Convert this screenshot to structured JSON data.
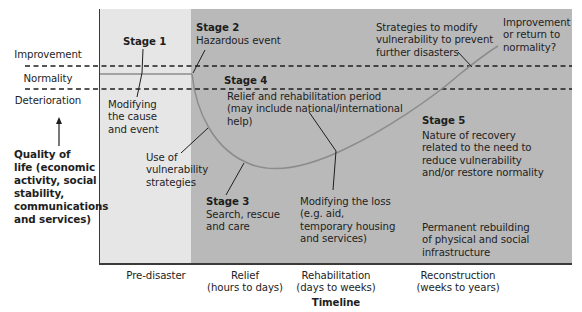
{
  "diagram": {
    "type": "disaster-response-curve",
    "colors": {
      "pre_disaster_region": "#e6e6e6",
      "post_disaster_region": "#b9b9b9",
      "curve": "#8c8c8c",
      "dashed_lines": "#1e1e1e",
      "text": "#1e1e1e"
    },
    "y_axis": {
      "levels": [
        "Improvement",
        "Normality",
        "Deterioration"
      ],
      "label": [
        "Quality of",
        "life (economic",
        "activity, social",
        "stability,",
        "communications",
        "and services)"
      ]
    },
    "x_axis": {
      "title": "Timeline",
      "phases": [
        {
          "line1": "Pre-disaster",
          "line2": ""
        },
        {
          "line1": "Relief",
          "line2": "(hours to days)"
        },
        {
          "line1": "Rehabilitation",
          "line2": "(days to weeks)"
        },
        {
          "line1": "Reconstruction",
          "line2": "(weeks to years)"
        }
      ]
    },
    "stages": [
      {
        "title": "Stage 1",
        "description": [
          "Modifying",
          "the cause",
          "and event"
        ]
      },
      {
        "title": "Stage 2",
        "description": [
          "Hazardous event"
        ]
      },
      {
        "title": "Stage 3",
        "description": [
          "Search, rescue",
          "and care"
        ]
      },
      {
        "title": "Stage 4",
        "description": [
          "Relief and rehabilitation period",
          "(may include national/international",
          "help)"
        ]
      },
      {
        "title": "Stage 5",
        "description": [
          "Nature of recovery",
          "related to the need to",
          "reduce vulnerability",
          "and/or restore normality"
        ]
      }
    ],
    "annotations": {
      "vulnerability_strategies": [
        "Use of",
        "vulnerability",
        "strategies"
      ],
      "modifying_loss": [
        "Modifying the loss",
        "(e.g. aid,",
        "temporary housing",
        "and services)"
      ],
      "strategies_modify": [
        "Strategies to modify",
        "vulnerability to prevent",
        "further disasters"
      ],
      "improvement_question": [
        "Improvement",
        "or return to",
        "normality?"
      ],
      "permanent_rebuilding": [
        "Permanent rebuilding",
        "of physical and social",
        "infrastructure"
      ]
    }
  }
}
